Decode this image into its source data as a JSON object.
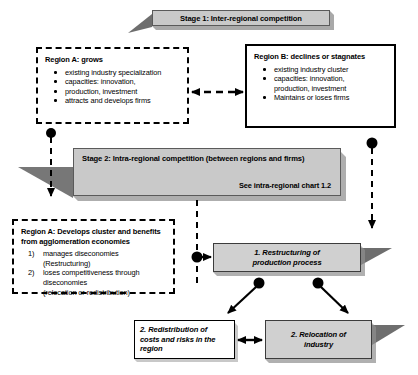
{
  "diagram": {
    "stage1": {
      "label": "Stage 1: Inter-regional competition"
    },
    "stage2": {
      "label": "Stage 2: Intra-regional competition (between regions and firms)",
      "note": "See intra-regional chart 1.2"
    },
    "region_a": {
      "title": "Region A: grows",
      "bullets": [
        "existing industry specialization",
        "capacities: innovation,",
        "production, investment",
        "attracts and develops firms"
      ]
    },
    "region_b": {
      "title": "Region B: declines or stagnates",
      "bullets": [
        "existing industry cluster",
        "capacities: innovation,",
        "production, investment",
        "Maintains or loses firms"
      ]
    },
    "region_a_cluster": {
      "title_line1": "Region A: Develops cluster and benefits",
      "title_line2": "from agglomeration economies",
      "items": [
        {
          "marker": "1)",
          "text": "manages diseconomies (Restructuring)"
        },
        {
          "marker": "2)",
          "text": "loses competitiveness through"
        }
      ],
      "continuation_line1": "diseconomies",
      "continuation_line2": "(relocation or redistribution)"
    },
    "outcomes": {
      "restructuring_line1": "1. Restructuring of",
      "restructuring_line2": "production process",
      "redistribution_line1": "2. Redistribution of",
      "redistribution_line2": "costs and risks in the",
      "redistribution_line3": "region",
      "relocation_line1": "2. Relocation of",
      "relocation_line2": "industry"
    },
    "caption": "",
    "colors": {
      "banner_fill": "#c9c9c9",
      "outcome_fill": "#d0d0d0",
      "shadow": "#6e6e6e",
      "line": "#000000"
    }
  }
}
